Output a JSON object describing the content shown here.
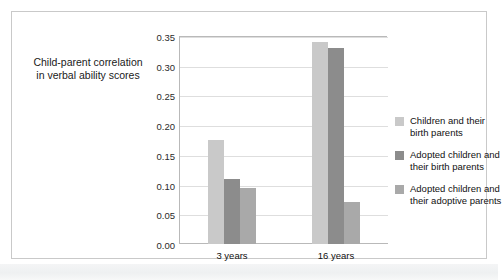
{
  "chart_data": {
    "type": "bar",
    "title": "",
    "xlabel": "Age of child",
    "ylabel": "Child-parent correlation in verbal ability scores",
    "ylabel_line1": "Child-parent correlation",
    "ylabel_line2": "in verbal ability scores",
    "categories": [
      "3 years",
      "16 years"
    ],
    "series": [
      {
        "name": "Children and their birth parents",
        "name_line1": "Children and their",
        "name_line2": "birth parents",
        "color": "#c9c9c9",
        "values": [
          0.175,
          0.34
        ]
      },
      {
        "name": "Adopted children and their birth parents",
        "name_line1": "Adopted children and",
        "name_line2": "their birth parents",
        "color": "#8c8c8c",
        "values": [
          0.11,
          0.33
        ]
      },
      {
        "name": "Adopted children and their adoptive parents",
        "name_line1": "Adopted children and",
        "name_line2": "their adoptive parents",
        "color": "#a9a9a9",
        "values": [
          0.095,
          0.07
        ]
      }
    ],
    "ylim": [
      0.0,
      0.35
    ],
    "ytick_step": 0.05,
    "yticks": [
      "0.00",
      "0.05",
      "0.10",
      "0.15",
      "0.20",
      "0.25",
      "0.30",
      "0.35"
    ],
    "ytick_values": [
      0.0,
      0.05,
      0.1,
      0.15,
      0.2,
      0.25,
      0.3,
      0.35
    ],
    "grid": true,
    "legend_position": "right"
  }
}
